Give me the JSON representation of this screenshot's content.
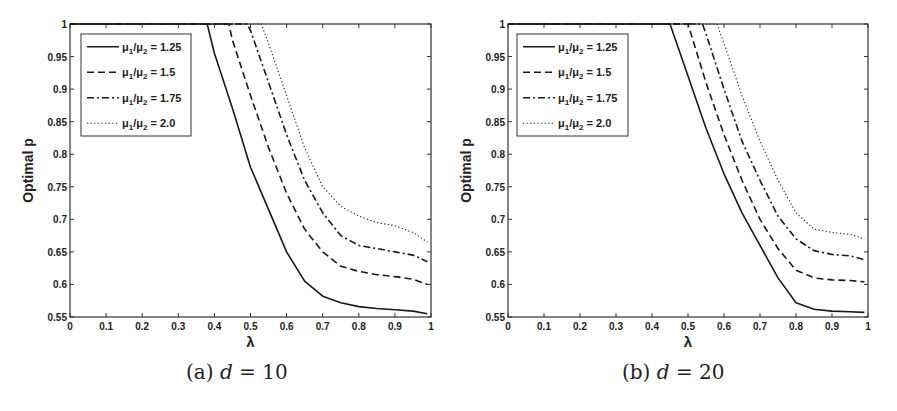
{
  "chart_data": [
    {
      "type": "line",
      "panel_label": "(a)",
      "caption_text": "(a) d = 10",
      "caption_prefix": "(a)",
      "caption_var": "d",
      "caption_eq": "= 10",
      "title": "",
      "xlabel": "λ",
      "ylabel": "Optimal p",
      "xlim": [
        0,
        1
      ],
      "ylim": [
        0.55,
        1
      ],
      "xticks": [
        "0",
        "0.1",
        "0.2",
        "0.3",
        "0.4",
        "0.5",
        "0.6",
        "0.7",
        "0.8",
        "0.9",
        "1"
      ],
      "yticks": [
        "0.55",
        "0.6",
        "0.65",
        "0.7",
        "0.75",
        "0.8",
        "0.85",
        "0.9",
        "0.95",
        "1"
      ],
      "grid": false,
      "legend_position": "upper left",
      "series": [
        {
          "name": "μ1/μ2 = 1.25",
          "style": "solid",
          "x": [
            0,
            0.38,
            0.4,
            0.45,
            0.5,
            0.55,
            0.6,
            0.65,
            0.7,
            0.75,
            0.8,
            0.85,
            0.9,
            0.95,
            0.99
          ],
          "y": [
            1,
            1,
            0.955,
            0.87,
            0.78,
            0.715,
            0.65,
            0.605,
            0.582,
            0.572,
            0.566,
            0.563,
            0.561,
            0.559,
            0.555
          ]
        },
        {
          "name": "μ1/μ2 = 1.5",
          "style": "dashed",
          "x": [
            0,
            0.44,
            0.45,
            0.5,
            0.55,
            0.6,
            0.65,
            0.7,
            0.75,
            0.8,
            0.85,
            0.9,
            0.95,
            0.99
          ],
          "y": [
            1,
            1,
            0.975,
            0.89,
            0.81,
            0.74,
            0.685,
            0.65,
            0.628,
            0.62,
            0.615,
            0.612,
            0.608,
            0.6
          ]
        },
        {
          "name": "μ1/μ2 = 1.75",
          "style": "dashdot",
          "x": [
            0,
            0.49,
            0.5,
            0.55,
            0.6,
            0.65,
            0.7,
            0.75,
            0.8,
            0.85,
            0.9,
            0.95,
            0.99
          ],
          "y": [
            1,
            1,
            0.99,
            0.91,
            0.83,
            0.76,
            0.71,
            0.675,
            0.66,
            0.655,
            0.65,
            0.645,
            0.635
          ]
        },
        {
          "name": "μ1/μ2 = 2.0",
          "style": "dotted",
          "x": [
            0,
            0.53,
            0.55,
            0.6,
            0.65,
            0.7,
            0.75,
            0.8,
            0.85,
            0.9,
            0.95,
            0.99
          ],
          "y": [
            1,
            1,
            0.97,
            0.89,
            0.81,
            0.75,
            0.72,
            0.705,
            0.695,
            0.69,
            0.68,
            0.665
          ]
        }
      ]
    },
    {
      "type": "line",
      "panel_label": "(b)",
      "caption_text": "(b) d = 20",
      "caption_prefix": "(b)",
      "caption_var": "d",
      "caption_eq": "= 20",
      "title": "",
      "xlabel": "λ",
      "ylabel": "Optimal p",
      "xlim": [
        0,
        1
      ],
      "ylim": [
        0.55,
        1
      ],
      "xticks": [
        "0",
        "0.1",
        "0.2",
        "0.3",
        "0.4",
        "0.5",
        "0.6",
        "0.7",
        "0.8",
        "0.9",
        "1"
      ],
      "yticks": [
        "0.55",
        "0.6",
        "0.65",
        "0.7",
        "0.75",
        "0.8",
        "0.85",
        "0.9",
        "0.95",
        "1"
      ],
      "grid": false,
      "legend_position": "upper left",
      "series": [
        {
          "name": "μ1/μ2 = 1.25",
          "style": "solid",
          "x": [
            0,
            0.45,
            0.5,
            0.55,
            0.6,
            0.65,
            0.7,
            0.75,
            0.8,
            0.85,
            0.9,
            0.95,
            0.99
          ],
          "y": [
            1,
            1,
            0.92,
            0.84,
            0.77,
            0.71,
            0.66,
            0.61,
            0.572,
            0.562,
            0.559,
            0.558,
            0.557
          ]
        },
        {
          "name": "μ1/μ2 = 1.5",
          "style": "dashed",
          "x": [
            0,
            0.5,
            0.55,
            0.6,
            0.65,
            0.7,
            0.75,
            0.8,
            0.85,
            0.9,
            0.95,
            0.99
          ],
          "y": [
            1,
            1,
            0.91,
            0.83,
            0.76,
            0.7,
            0.655,
            0.622,
            0.61,
            0.607,
            0.606,
            0.604
          ]
        },
        {
          "name": "μ1/μ2 = 1.75",
          "style": "dashdot",
          "x": [
            0,
            0.54,
            0.55,
            0.6,
            0.65,
            0.7,
            0.75,
            0.8,
            0.85,
            0.9,
            0.95,
            0.99
          ],
          "y": [
            1,
            1,
            0.985,
            0.9,
            0.82,
            0.76,
            0.705,
            0.67,
            0.652,
            0.646,
            0.644,
            0.638
          ]
        },
        {
          "name": "μ1/μ2 = 2.0",
          "style": "dotted",
          "x": [
            0,
            0.58,
            0.6,
            0.65,
            0.7,
            0.75,
            0.8,
            0.85,
            0.9,
            0.95,
            0.99
          ],
          "y": [
            1,
            1,
            0.97,
            0.89,
            0.82,
            0.76,
            0.71,
            0.685,
            0.68,
            0.677,
            0.67
          ]
        }
      ]
    }
  ],
  "legend": {
    "entries": [
      {
        "base": "μ",
        "s1": "1",
        "slash": "/",
        "base2": "μ",
        "s2": "2",
        "value": " = 1.25"
      },
      {
        "base": "μ",
        "s1": "1",
        "slash": "/",
        "base2": "μ",
        "s2": "2",
        "value": " = 1.5"
      },
      {
        "base": "μ",
        "s1": "1",
        "slash": "/",
        "base2": "μ",
        "s2": "2",
        "value": " = 1.75"
      },
      {
        "base": "μ",
        "s1": "1",
        "slash": "/",
        "base2": "μ",
        "s2": "2",
        "value": " = 2.0"
      }
    ]
  },
  "style": {
    "line_color": "#1a1a1a",
    "axis_color": "#333333",
    "background": "#ffffff"
  }
}
